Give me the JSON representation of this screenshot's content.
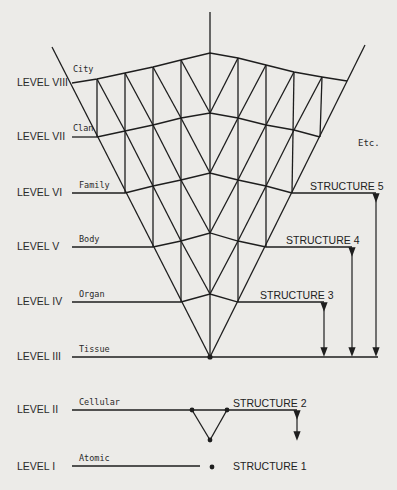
{
  "diagram": {
    "levels": [
      {
        "level": "LEVEL VIII",
        "tag": "City"
      },
      {
        "level": "LEVEL VII",
        "tag": "Clan"
      },
      {
        "level": "LEVEL VI",
        "tag": "Family"
      },
      {
        "level": "LEVEL V",
        "tag": "Body"
      },
      {
        "level": "LEVEL IV",
        "tag": "Organ"
      },
      {
        "level": "LEVEL III",
        "tag": "Tissue"
      },
      {
        "level": "LEVEL II",
        "tag": "Cellular"
      },
      {
        "level": "LEVEL I",
        "tag": "Atomic"
      }
    ],
    "structures": [
      {
        "label": "STRUCTURE 5"
      },
      {
        "label": "STRUCTURE 4"
      },
      {
        "label": "STRUCTURE 3"
      },
      {
        "label": "STRUCTURE 2"
      },
      {
        "label": "STRUCTURE 1"
      }
    ],
    "etc_label": "Etc.",
    "line_color": "#1e1e1e",
    "background_color": "#ecebe8"
  }
}
